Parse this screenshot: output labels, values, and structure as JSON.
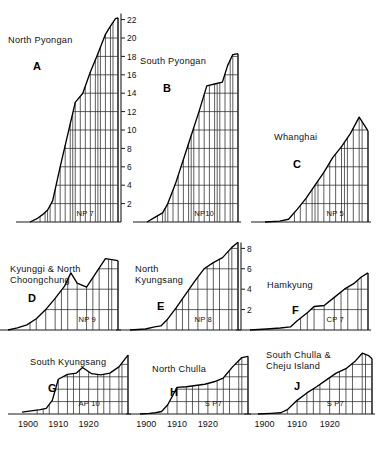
{
  "figure": {
    "title": "",
    "xaxis_ticks": [
      "1900",
      "1910",
      "1920"
    ],
    "row_baselines": [
      222,
      330,
      414
    ],
    "x_start_year": 1898,
    "x_end_year": 1933
  },
  "chart_data": {
    "type": "line",
    "title": "",
    "xlabel": "",
    "ylabel": "",
    "xlim": [
      1898,
      1933
    ],
    "xticks": [
      1900,
      1910,
      1920
    ],
    "grid": true,
    "legend": "none",
    "panels": [
      {
        "key": "A",
        "letter": "A",
        "name": "North Pyongan",
        "title_lines": [
          "North Pyongan"
        ],
        "source": "NP 7",
        "yticks": [
          2,
          4,
          6,
          8,
          10,
          12,
          14,
          16,
          18,
          20,
          22
        ],
        "ylim": [
          0,
          23
        ],
        "yaxis_side": "right",
        "x": [
          1898,
          1901,
          1903,
          1905,
          1907,
          1910,
          1913,
          1916,
          1919,
          1922,
          1925,
          1928,
          1930,
          1932,
          1933
        ],
        "y": [
          0,
          0.4,
          0.8,
          1.3,
          2.3,
          6.0,
          9.5,
          13.0,
          14.0,
          16.3,
          18.3,
          20.4,
          21.3,
          22.1,
          22.2
        ]
      },
      {
        "key": "B",
        "letter": "B",
        "name": "South Pyongan",
        "title_lines": [
          "South Pyongan"
        ],
        "source": "NP10",
        "yticks": [
          2,
          4,
          6,
          8,
          10,
          12,
          14,
          16,
          18,
          20,
          22
        ],
        "ylim": [
          0,
          23
        ],
        "yaxis_side": "none",
        "x": [
          1898,
          1901,
          1904,
          1906,
          1909,
          1912,
          1915,
          1918,
          1921,
          1924,
          1927,
          1929,
          1931,
          1933
        ],
        "y": [
          0,
          0.5,
          1.0,
          2.0,
          4.2,
          6.8,
          9.4,
          12.0,
          14.8,
          15.0,
          15.2,
          17.0,
          18.2,
          18.3
        ]
      },
      {
        "key": "C",
        "letter": "C",
        "name": "Whanghai",
        "title_lines": [
          "Whanghai"
        ],
        "source": "NP 5",
        "yticks": [
          2,
          4,
          6,
          8,
          10,
          12
        ],
        "ylim": [
          0,
          23
        ],
        "yaxis_side": "none",
        "x": [
          1898,
          1903,
          1906,
          1909,
          1912,
          1915,
          1918,
          1921,
          1924,
          1927,
          1930,
          1933
        ],
        "y": [
          0,
          0.1,
          0.3,
          1.4,
          2.6,
          4.0,
          5.4,
          7.0,
          8.2,
          9.6,
          11.4,
          9.9
        ]
      },
      {
        "key": "D",
        "letter": "D",
        "name": "Kyunggi & North Choongchung",
        "title_lines": [
          "Kyunggi & North",
          "Choongchung"
        ],
        "source": "NP 9",
        "yticks": [],
        "ylim": [
          0,
          9
        ],
        "yaxis_side": "none",
        "x": [
          1898,
          1901,
          1904,
          1907,
          1910,
          1913,
          1916,
          1918,
          1920,
          1923,
          1926,
          1929,
          1931,
          1933
        ],
        "y": [
          0,
          0.2,
          0.5,
          1.1,
          2.0,
          3.1,
          4.3,
          5.6,
          4.6,
          4.2,
          5.6,
          7.0,
          6.9,
          6.8
        ]
      },
      {
        "key": "E",
        "letter": "E",
        "name": "North Kyungsang",
        "title_lines": [
          "North",
          "Kyungsang"
        ],
        "source": "NP 8",
        "yticks": [
          2,
          4,
          6,
          8
        ],
        "ylim": [
          0,
          9
        ],
        "yaxis_side": "right",
        "x": [
          1898,
          1903,
          1906,
          1908,
          1910,
          1913,
          1916,
          1919,
          1922,
          1925,
          1928,
          1931,
          1933
        ],
        "y": [
          0,
          0.1,
          0.3,
          0.4,
          1.0,
          2.2,
          3.5,
          4.8,
          6.0,
          6.6,
          7.1,
          8.1,
          8.6
        ]
      },
      {
        "key": "F",
        "letter": "F",
        "name": "Hamkyung",
        "title_lines": [
          "Hamkyung"
        ],
        "source": "CP 7",
        "yticks": [],
        "ylim": [
          0,
          9
        ],
        "yaxis_side": "none",
        "x": [
          1898,
          1903,
          1907,
          1910,
          1912,
          1915,
          1917,
          1920,
          1923,
          1926,
          1929,
          1931,
          1933
        ],
        "y": [
          0,
          0.1,
          0.2,
          0.3,
          0.9,
          1.7,
          2.3,
          2.4,
          3.2,
          4.0,
          4.6,
          5.2,
          5.6
        ]
      },
      {
        "key": "G",
        "letter": "G",
        "name": "South Kyungsang",
        "title_lines": [
          "South Kyungsang"
        ],
        "source": "AP 10",
        "yticks": [],
        "ylim": [
          0,
          10
        ],
        "yaxis_side": "none",
        "show_xaxis": true,
        "x": [
          1898,
          1901,
          1904,
          1906,
          1908,
          1910,
          1913,
          1916,
          1918,
          1921,
          1924,
          1927,
          1930,
          1933
        ],
        "y": [
          0.3,
          0.5,
          0.7,
          0.9,
          2.2,
          5.6,
          6.4,
          6.6,
          7.5,
          6.5,
          6.3,
          6.6,
          7.6,
          9.5
        ]
      },
      {
        "key": "H",
        "letter": "H",
        "name": "North Chulla",
        "title_lines": [
          "North Chulla"
        ],
        "source": "S P7",
        "source_parts": [
          "S",
          "P7"
        ],
        "yticks": [],
        "ylim": [
          0,
          10
        ],
        "yaxis_side": "none",
        "show_xaxis": true,
        "x": [
          1898,
          1901,
          1903,
          1905,
          1907,
          1910,
          1913,
          1916,
          1919,
          1922,
          1925,
          1928,
          1931,
          1933
        ],
        "y": [
          0,
          0.1,
          0.2,
          0.4,
          1.5,
          4.3,
          4.4,
          4.6,
          4.8,
          5.2,
          5.8,
          7.6,
          9.1,
          9.3
        ]
      },
      {
        "key": "J",
        "letter": "J",
        "name": "South Chulla & Cheju Island",
        "title_lines": [
          "South Chulla &",
          "Cheju Island"
        ],
        "source": "S P7",
        "source_parts": [
          "S",
          "P7"
        ],
        "yticks": [],
        "ylim": [
          0,
          10
        ],
        "yaxis_side": "none",
        "show_xaxis": true,
        "x": [
          1898,
          1902,
          1905,
          1907,
          1910,
          1913,
          1916,
          1919,
          1922,
          1925,
          1928,
          1930,
          1932,
          1933
        ],
        "y": [
          0,
          0.1,
          0.2,
          0.7,
          2.2,
          3.4,
          4.4,
          5.5,
          6.6,
          7.3,
          8.6,
          9.8,
          9.4,
          8.9
        ]
      }
    ]
  }
}
